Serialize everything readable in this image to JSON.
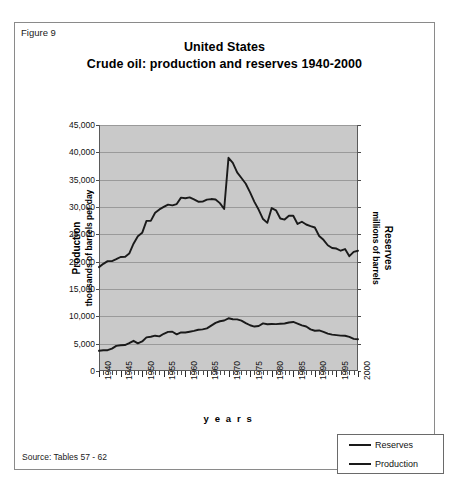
{
  "figure": {
    "label": "Figure 9",
    "title_line1": "United States",
    "title_line2": "Crude oil: production and reserves 1940-2000",
    "source": "Source: Tables 57 - 62"
  },
  "legend": {
    "items": [
      {
        "label": "Reserves",
        "color": "#1a1a1a"
      },
      {
        "label": "Production",
        "color": "#1a1a1a"
      }
    ]
  },
  "chart_data": {
    "type": "line",
    "title": "United States Crude oil: production and reserves 1940-2000",
    "xlabel": "y e a r s",
    "ylabel": "Production thousands of barrels per day",
    "y2label": "Reserves millions of barrels",
    "xlim": [
      1940,
      2000
    ],
    "ylim": [
      0,
      45000
    ],
    "grid": true,
    "legend_position": "bottom-right-outside",
    "ytick_labels": [
      "0",
      "5,000",
      "10,000",
      "15,000",
      "20,000",
      "25,000",
      "30,000",
      "35,000",
      "40,000",
      "45,000"
    ],
    "ytick_values": [
      0,
      5000,
      10000,
      15000,
      20000,
      25000,
      30000,
      35000,
      40000,
      45000
    ],
    "xtick_labels": [
      "1940",
      "1945",
      "1950",
      "1955",
      "1960",
      "1965",
      "1970",
      "1975",
      "1980",
      "1985",
      "1990",
      "1995",
      "2000"
    ],
    "xtick_values": [
      1940,
      1945,
      1950,
      1955,
      1960,
      1965,
      1970,
      1975,
      1980,
      1985,
      1990,
      1995,
      2000
    ],
    "x": [
      1940,
      1941,
      1942,
      1943,
      1944,
      1945,
      1946,
      1947,
      1948,
      1949,
      1950,
      1951,
      1952,
      1953,
      1954,
      1955,
      1956,
      1957,
      1958,
      1959,
      1960,
      1961,
      1962,
      1963,
      1964,
      1965,
      1966,
      1967,
      1968,
      1969,
      1970,
      1971,
      1972,
      1973,
      1974,
      1975,
      1976,
      1977,
      1978,
      1979,
      1980,
      1981,
      1982,
      1983,
      1984,
      1985,
      1986,
      1987,
      1988,
      1989,
      1990,
      1991,
      1992,
      1993,
      1994,
      1995,
      1996,
      1997,
      1998,
      1999,
      2000
    ],
    "series": [
      {
        "name": "Reserves",
        "unit": "millions of barrels",
        "axis": "right",
        "values": [
          19000,
          19600,
          20100,
          20100,
          20450,
          20850,
          20870,
          21490,
          23280,
          24650,
          25270,
          27460,
          27470,
          28950,
          29560,
          30010,
          30440,
          30300,
          30540,
          31720,
          31610,
          31760,
          31390,
          30970,
          30990,
          31350,
          31450,
          31380,
          30710,
          29630,
          39000,
          38060,
          36340,
          35300,
          34250,
          32680,
          30940,
          29490,
          27800,
          27100,
          29800,
          29400,
          27900,
          27700,
          28400,
          28400,
          26900,
          27300,
          26800,
          26500,
          26250,
          24700,
          24000,
          23000,
          22500,
          22400,
          22000,
          22300,
          21000,
          21800,
          22000
        ]
      },
      {
        "name": "Production",
        "unit": "thousands of barrels per day",
        "axis": "left",
        "values": [
          3700,
          3800,
          3800,
          4100,
          4600,
          4700,
          4750,
          5100,
          5520,
          5050,
          5400,
          6160,
          6260,
          6460,
          6340,
          6810,
          7150,
          7170,
          6710,
          7050,
          7040,
          7180,
          7330,
          7540,
          7610,
          7800,
          8300,
          8810,
          9100,
          9240,
          9640,
          9460,
          9440,
          9210,
          8770,
          8370,
          8130,
          8240,
          8710,
          8550,
          8600,
          8570,
          8650,
          8690,
          8880,
          8970,
          8680,
          8350,
          8140,
          7610,
          7360,
          7420,
          7170,
          6850,
          6660,
          6560,
          6470,
          6450,
          6250,
          5880,
          5820
        ]
      }
    ]
  }
}
